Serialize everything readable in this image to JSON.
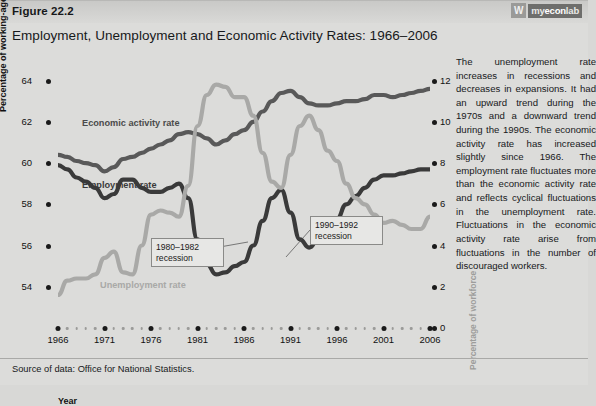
{
  "header": {
    "figure_number": "Figure 22.2",
    "title": "Employment, Unemployment and Economic Activity Rates: 1966–2006",
    "logo_mark": "W",
    "logo_prefix": "my",
    "logo_mid": "econ",
    "logo_suffix": "lab"
  },
  "chart_data": {
    "type": "line",
    "title": "Employment, Unemployment and Economic Activity Rates: 1966–2006",
    "xlabel": "Year",
    "ylabel": "Percentage of working-age population",
    "ylabel_right": "Percentage of workforce",
    "xlim": [
      1966,
      2006
    ],
    "ylim": [
      52,
      65
    ],
    "ylim_right": [
      0,
      13
    ],
    "grid": false,
    "legend": "inline-labels",
    "xticks": [
      "1966",
      "1971",
      "1976",
      "1981",
      "1986",
      "1991",
      "1996",
      "2001",
      "2006"
    ],
    "yticks_left": [
      "64",
      "62",
      "60",
      "58",
      "56",
      "54"
    ],
    "yticks_right": [
      "12",
      "10",
      "8",
      "6",
      "4",
      "2",
      "0"
    ],
    "x": [
      1966,
      1967,
      1968,
      1969,
      1970,
      1971,
      1972,
      1973,
      1974,
      1975,
      1976,
      1977,
      1978,
      1979,
      1980,
      1981,
      1982,
      1983,
      1984,
      1985,
      1986,
      1987,
      1988,
      1989,
      1990,
      1991,
      1992,
      1993,
      1994,
      1995,
      1996,
      1997,
      1998,
      1999,
      2000,
      2001,
      2002,
      2003,
      2004,
      2005,
      2006
    ],
    "series": [
      {
        "name": "Economic activity rate",
        "axis": "left",
        "color": "#595959",
        "values": [
          60.4,
          60.3,
          60.1,
          60.0,
          59.9,
          59.6,
          59.8,
          60.2,
          60.3,
          60.5,
          60.7,
          60.9,
          61.1,
          61.4,
          61.5,
          61.4,
          61.2,
          60.9,
          61.1,
          61.4,
          61.6,
          62.0,
          62.5,
          63.0,
          63.4,
          63.5,
          63.2,
          62.9,
          62.8,
          62.8,
          62.9,
          63.0,
          63.0,
          63.1,
          63.3,
          63.3,
          63.2,
          63.3,
          63.4,
          63.5,
          63.6
        ]
      },
      {
        "name": "Employment rate",
        "axis": "left",
        "color": "#3a3a3a",
        "values": [
          59.9,
          59.7,
          59.3,
          59.1,
          58.8,
          58.3,
          58.5,
          59.2,
          59.2,
          58.8,
          58.6,
          58.6,
          58.8,
          59.0,
          58.3,
          56.3,
          55.1,
          54.6,
          54.7,
          55.0,
          55.2,
          56.0,
          57.2,
          58.3,
          58.7,
          57.6,
          56.3,
          55.9,
          56.3,
          56.8,
          57.3,
          58.0,
          58.4,
          58.8,
          59.2,
          59.4,
          59.4,
          59.5,
          59.6,
          59.7,
          59.7
        ]
      },
      {
        "name": "Unemployment rate",
        "axis": "right",
        "color": "#a9a9a7",
        "values": [
          1.6,
          2.3,
          2.4,
          2.4,
          2.6,
          3.4,
          3.7,
          2.7,
          2.6,
          4.0,
          5.5,
          5.7,
          5.6,
          5.4,
          6.9,
          9.8,
          11.3,
          11.8,
          11.7,
          11.2,
          11.2,
          10.3,
          8.5,
          7.1,
          6.8,
          8.4,
          9.8,
          10.3,
          9.6,
          8.6,
          8.1,
          7.0,
          6.3,
          6.0,
          5.5,
          5.1,
          5.2,
          5.0,
          4.8,
          4.8,
          5.4
        ]
      }
    ],
    "annotations": [
      {
        "label_line1": "1980–1982",
        "label_line2": "recession",
        "points_to_series": "Employment rate",
        "points_to_year": 1983
      },
      {
        "label_line1": "1990–1992",
        "label_line2": "recession",
        "points_to_series": "Unemployment rate",
        "points_to_year": 1993
      }
    ]
  },
  "side_text": {
    "paragraph": "The unemployment rate increases in recessions and decreases in expansions. It had an upward trend during the 1970s and a downward trend during the 1990s. The economic activity rate has increased slightly since 1966. The employment rate fluctuates more than the economic activity rate and reflects cyclical fluctuations in the unemployment rate. Fluctuations in the economic activity rate arise from fluctuations in the number of discouraged workers."
  },
  "footer": {
    "source": "Source of data: Office for National Statistics."
  }
}
